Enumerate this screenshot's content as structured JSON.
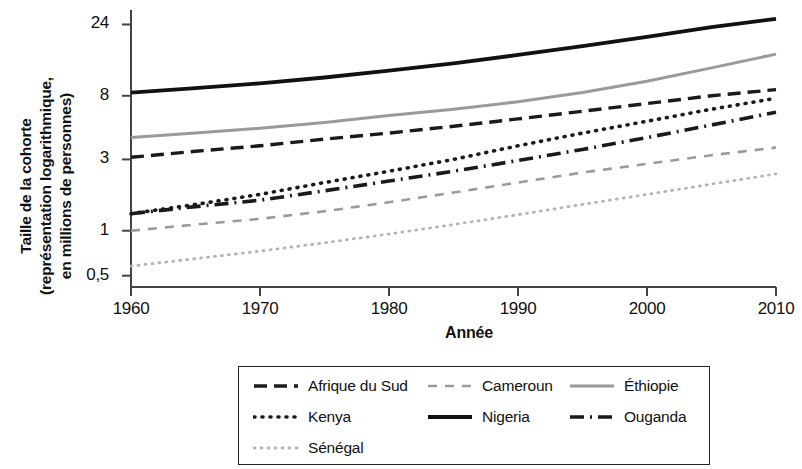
{
  "chart_data": {
    "type": "line",
    "title": "",
    "xlabel": "Année",
    "ylabel_lines": [
      "Taille de la cohorte",
      "(représentation logarithmique,",
      "en millions de personnes)"
    ],
    "ylabel": "Taille de la cohorte (représentation logarithmique, en millions de personnes)",
    "y_scale": "log",
    "y_ticks": [
      "24",
      "8",
      "3",
      "1",
      "0,5"
    ],
    "y_tick_values": [
      24,
      8,
      3,
      1,
      0.5
    ],
    "ylim": [
      0.42,
      30
    ],
    "x_ticks": [
      "1960",
      "1970",
      "1980",
      "1990",
      "2000",
      "2010"
    ],
    "x_tick_values": [
      1960,
      1970,
      1980,
      1990,
      2000,
      2010
    ],
    "xlim": [
      1960,
      2010
    ],
    "grid": false,
    "legend_position": "bottom",
    "x": [
      1960,
      1965,
      1970,
      1975,
      1980,
      1985,
      1990,
      1995,
      2000,
      2005,
      2010
    ],
    "series": [
      {
        "name": "Afrique du Sud",
        "style": "dashed",
        "color": "#1a1a1a",
        "width": 3.4,
        "dash": "13,7",
        "values": [
          3.1,
          3.4,
          3.7,
          4.1,
          4.5,
          5.0,
          5.6,
          6.3,
          7.1,
          8.0,
          8.8
        ]
      },
      {
        "name": "Cameroun",
        "style": "dashed",
        "color": "#9a9a9a",
        "width": 2.6,
        "dash": "9,8",
        "values": [
          1.0,
          1.1,
          1.2,
          1.35,
          1.55,
          1.8,
          2.1,
          2.45,
          2.8,
          3.2,
          3.6
        ]
      },
      {
        "name": "Éthiopie",
        "style": "solid",
        "color": "#9a9a9a",
        "width": 3.0,
        "dash": "none",
        "values": [
          4.2,
          4.5,
          4.85,
          5.3,
          5.9,
          6.5,
          7.3,
          8.4,
          10.0,
          12.3,
          15.2
        ]
      },
      {
        "name": "Kenya",
        "style": "dotted",
        "color": "#1a1a1a",
        "width": 3.6,
        "dash": "1,7",
        "values": [
          1.3,
          1.5,
          1.75,
          2.1,
          2.5,
          3.0,
          3.7,
          4.5,
          5.4,
          6.5,
          7.7
        ]
      },
      {
        "name": "Nigeria",
        "style": "solid",
        "color": "#111111",
        "width": 3.8,
        "dash": "none",
        "values": [
          8.4,
          9.0,
          9.7,
          10.6,
          11.8,
          13.2,
          15.0,
          17.2,
          19.8,
          23.0,
          26.2
        ]
      },
      {
        "name": "Ouganda",
        "style": "dashdot",
        "color": "#1a1a1a",
        "width": 3.6,
        "dash": "14,6,2,6",
        "values": [
          1.3,
          1.45,
          1.6,
          1.85,
          2.15,
          2.5,
          2.95,
          3.5,
          4.2,
          5.1,
          6.2
        ]
      },
      {
        "name": "Sénégal",
        "style": "dotted",
        "color": "#b4b4b4",
        "width": 2.8,
        "dash": "1,6",
        "values": [
          0.58,
          0.65,
          0.73,
          0.83,
          0.95,
          1.1,
          1.28,
          1.5,
          1.75,
          2.05,
          2.4
        ]
      }
    ]
  },
  "legend": {
    "entries": [
      {
        "label": "Afrique du Sud",
        "series": "Afrique du Sud"
      },
      {
        "label": "Cameroun",
        "series": "Cameroun"
      },
      {
        "label": "Éthiopie",
        "series": "Éthiopie"
      },
      {
        "label": "Kenya",
        "series": "Kenya"
      },
      {
        "label": "Nigeria",
        "series": "Nigeria"
      },
      {
        "label": "Ouganda",
        "series": "Ouganda"
      },
      {
        "label": "Sénégal",
        "series": "Sénégal"
      }
    ]
  }
}
